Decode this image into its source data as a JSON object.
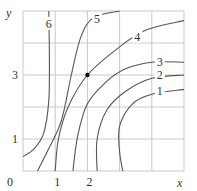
{
  "chart_data": {
    "type": "contour",
    "title": "",
    "xlabel": "x",
    "ylabel": "y",
    "xlim": [
      0,
      5
    ],
    "ylim": [
      0,
      5
    ],
    "grid": true,
    "x_ticks": [
      {
        "value": 0,
        "label": "0"
      },
      {
        "value": 1,
        "label": "1"
      },
      {
        "value": 2,
        "label": "2"
      }
    ],
    "y_ticks": [
      {
        "value": 1,
        "label": "1"
      },
      {
        "value": 3,
        "label": "3"
      }
    ],
    "contour_levels": [
      "1",
      "2",
      "3",
      "4",
      "5",
      "6"
    ],
    "marked_point": {
      "x": 2,
      "y": 3
    },
    "contours": [
      {
        "level": "6",
        "points": [
          [
            0.8,
            5.0
          ],
          [
            0.82,
            3.5
          ],
          [
            0.8,
            2.2
          ],
          [
            0.65,
            1.2
          ],
          [
            0.35,
            0.7
          ],
          [
            0.0,
            0.45
          ]
        ]
      },
      {
        "level": "5",
        "points": [
          [
            3.0,
            5.0
          ],
          [
            2.2,
            4.8
          ],
          [
            1.8,
            4.2
          ],
          [
            1.5,
            3.0
          ],
          [
            1.2,
            1.6
          ],
          [
            0.8,
            0.7
          ],
          [
            0.45,
            0.0
          ]
        ]
      },
      {
        "level": "4",
        "points": [
          [
            5.0,
            4.7
          ],
          [
            3.8,
            4.4
          ],
          [
            2.9,
            3.8
          ],
          [
            2.0,
            3.0
          ],
          [
            1.4,
            2.0
          ],
          [
            1.1,
            1.0
          ],
          [
            1.0,
            0.0
          ]
        ]
      },
      {
        "level": "3",
        "points": [
          [
            5.0,
            3.4
          ],
          [
            4.0,
            3.4
          ],
          [
            3.2,
            3.2
          ],
          [
            2.6,
            2.8
          ],
          [
            2.0,
            2.1
          ],
          [
            1.7,
            1.1
          ],
          [
            1.55,
            0.0
          ]
        ]
      },
      {
        "level": "2",
        "points": [
          [
            5.0,
            3.0
          ],
          [
            4.0,
            2.9
          ],
          [
            3.2,
            2.5
          ],
          [
            2.6,
            1.9
          ],
          [
            2.3,
            1.0
          ],
          [
            2.3,
            0.0
          ]
        ]
      },
      {
        "level": "1",
        "points": [
          [
            5.0,
            2.55
          ],
          [
            4.0,
            2.4
          ],
          [
            3.4,
            2.1
          ],
          [
            3.0,
            1.4
          ],
          [
            3.0,
            0.6
          ],
          [
            3.1,
            0.0
          ]
        ]
      }
    ]
  }
}
